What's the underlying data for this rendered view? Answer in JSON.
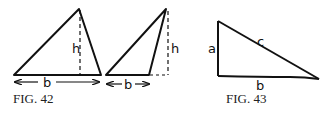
{
  "figures": [
    {
      "caption": "FIG. 42",
      "triangles": [
        {
          "labels": {
            "height": "h",
            "base": "b"
          }
        },
        {
          "labels": {
            "height": "h",
            "base": "b"
          }
        }
      ]
    },
    {
      "caption": "FIG. 43",
      "labels": {
        "side_a": "a",
        "side_b": "b",
        "side_c": "c"
      }
    }
  ],
  "colors": {
    "stroke": "#111111",
    "background": "#ffffff"
  }
}
